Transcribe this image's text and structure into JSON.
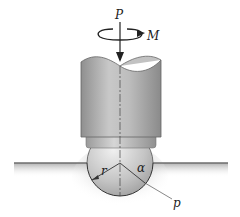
{
  "figure": {
    "labels": {
      "force": "P",
      "moment": "M",
      "radius": "r",
      "angle": "α",
      "pressure": "p"
    },
    "colors": {
      "cylinder_dark": "#8a8a8a",
      "cylinder_light": "#d8d8d8",
      "sphere": "#cfcfcf",
      "ground": "#7a7a7a",
      "line": "#222222"
    }
  }
}
